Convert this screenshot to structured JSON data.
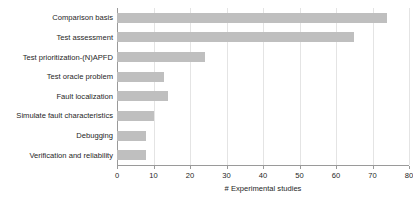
{
  "chart_data": {
    "type": "bar",
    "orientation": "horizontal",
    "title": "",
    "xlabel": "# Experimental studies",
    "ylabel": "",
    "xlim": [
      0,
      80
    ],
    "xticks": [
      0,
      10,
      20,
      30,
      40,
      50,
      60,
      70,
      80
    ],
    "grid": true,
    "legend": false,
    "bar_color": "#bfbfbf",
    "categories": [
      "Comparison basis",
      "Test assessment",
      "Test prioritization-(N)APFD",
      "Test oracle problem",
      "Fault localization",
      "Simulate fault characteristics",
      "Debugging",
      "Verification and reliability"
    ],
    "values": [
      74,
      65,
      24,
      13,
      14,
      10,
      8,
      8
    ]
  }
}
